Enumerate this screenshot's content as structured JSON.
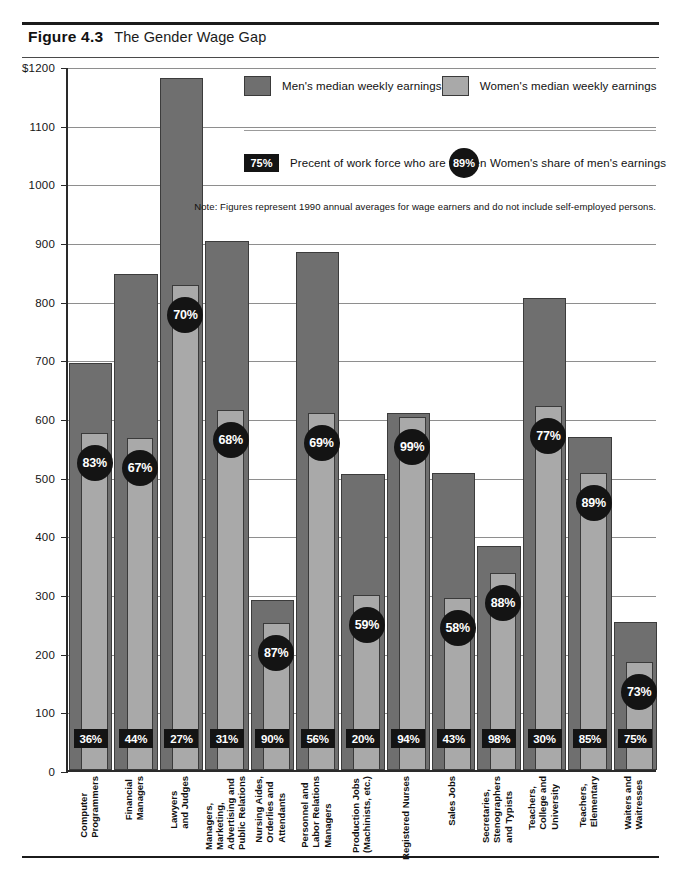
{
  "figure": {
    "number": "Figure 4.3",
    "title": "The Gender Wage Gap"
  },
  "legend": {
    "men_label": "Men's median weekly earnings",
    "women_label": "Women's median weekly earnings",
    "workforce_sample": "75%",
    "workforce_label": "Precent of work force who are women",
    "share_sample": "89%",
    "share_label": "Women's share of men's earnings"
  },
  "note": "Note: Figures represent 1990 annual averages for wage earners and do not include self-employed persons.",
  "chart_data": {
    "type": "bar",
    "title": "The Gender Wage Gap",
    "xlabel": "",
    "ylabel": "",
    "ylim": [
      0,
      1200
    ],
    "ytick_labels": [
      "$1200",
      "1100",
      "1000",
      "900",
      "800",
      "700",
      "600",
      "500",
      "400",
      "300",
      "200",
      "100",
      "0"
    ],
    "ytick_values": [
      1200,
      1100,
      1000,
      900,
      800,
      700,
      600,
      500,
      400,
      300,
      200,
      100,
      0
    ],
    "grid": true,
    "legend_position": "top-right",
    "categories": [
      "Computer\nProgrammers",
      "Financial\nManagers",
      "Lawyers\nand Judges",
      "Managers,\nMarketing,\nAdvertising and\nPublic Relations",
      "Nursing Aides,\nOrderlies and\nAttendants",
      "Personnel and\nLabor Relations\nManagers",
      "Production Jobs\n(Machinists, etc.)",
      "Registered Nurses",
      "Sales Jobs",
      "Secretaries,\nStenographers\nand Typists",
      "Teachers,\nCollege and\nUniversity",
      "Teachers,\nElementary",
      "Waiters and\nWaitresses"
    ],
    "series": [
      {
        "name": "Men's median weekly earnings",
        "color": "#6f6f6f",
        "values": [
          693,
          845,
          1180,
          901,
          289,
          883,
          505,
          608,
          506,
          382,
          805,
          568,
          252
        ]
      },
      {
        "name": "Women's median weekly earnings",
        "color": "#a9a9a9",
        "values": [
          575,
          566,
          826,
          613,
          251,
          609,
          298,
          602,
          293,
          336,
          620,
          506,
          184
        ]
      }
    ],
    "share_of_mens_earnings": [
      "83%",
      "67%",
      "70%",
      "68%",
      "87%",
      "69%",
      "59%",
      "99%",
      "58%",
      "88%",
      "77%",
      "89%",
      "73%"
    ],
    "percent_workforce_women": [
      "36%",
      "44%",
      "27%",
      "31%",
      "90%",
      "56%",
      "20%",
      "94%",
      "43%",
      "98%",
      "30%",
      "85%",
      "75%"
    ]
  },
  "colors": {
    "men_bar": "#6f6f6f",
    "women_bar": "#a9a9a9",
    "badge": "#141414",
    "axis": "#2a2a2a",
    "grid": "#8e8e8e"
  }
}
